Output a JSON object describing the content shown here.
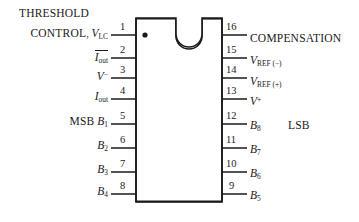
{
  "diagram": {
    "package": {
      "notch": "top-center-u-notch",
      "pin1_marker": "dot",
      "stroke_color": "#1a1a1a",
      "fill_color": "#ffffff"
    },
    "left_pins": [
      {
        "number": "1",
        "prefix": "THRESHOLD CONTROL",
        "separator": ",",
        "symbol": "V",
        "sub": "LC",
        "sup": "",
        "overline": false,
        "tag": ""
      },
      {
        "number": "2",
        "prefix": "",
        "separator": "",
        "symbol": "I",
        "sub": "out",
        "sup": "",
        "overline": true,
        "tag": ""
      },
      {
        "number": "3",
        "prefix": "",
        "separator": "",
        "symbol": "V",
        "sub": "",
        "sup": "−",
        "overline": false,
        "tag": ""
      },
      {
        "number": "4",
        "prefix": "",
        "separator": "",
        "symbol": "I",
        "sub": "out",
        "sup": "",
        "overline": false,
        "tag": ""
      },
      {
        "number": "5",
        "prefix": "",
        "separator": "",
        "symbol": "B",
        "sub": "1",
        "sup": "",
        "overline": false,
        "tag": "MSB"
      },
      {
        "number": "6",
        "prefix": "",
        "separator": "",
        "symbol": "B",
        "sub": "2",
        "sup": "",
        "overline": false,
        "tag": ""
      },
      {
        "number": "7",
        "prefix": "",
        "separator": "",
        "symbol": "B",
        "sub": "3",
        "sup": "",
        "overline": false,
        "tag": ""
      },
      {
        "number": "8",
        "prefix": "",
        "separator": "",
        "symbol": "B",
        "sub": "4",
        "sup": "",
        "overline": false,
        "tag": ""
      }
    ],
    "right_pins": [
      {
        "number": "16",
        "symbol": "",
        "sub": "",
        "sup": "",
        "word": "COMPENSATION",
        "tag": ""
      },
      {
        "number": "15",
        "symbol": "V",
        "sub": "REF (−)",
        "sup": "",
        "word": "",
        "tag": ""
      },
      {
        "number": "14",
        "symbol": "V",
        "sub": "REF (+)",
        "sup": "",
        "word": "",
        "tag": ""
      },
      {
        "number": "13",
        "symbol": "V",
        "sub": "",
        "sup": "+",
        "word": "",
        "tag": ""
      },
      {
        "number": "12",
        "symbol": "B",
        "sub": "8",
        "sup": "",
        "word": "",
        "tag": "LSB"
      },
      {
        "number": "11",
        "symbol": "B",
        "sub": "7",
        "sup": "",
        "word": "",
        "tag": ""
      },
      {
        "number": "10",
        "symbol": "B",
        "sub": "6",
        "sup": "",
        "word": "",
        "tag": ""
      },
      {
        "number": "9",
        "symbol": "B",
        "sub": "5",
        "sup": "",
        "word": "",
        "tag": ""
      }
    ]
  }
}
